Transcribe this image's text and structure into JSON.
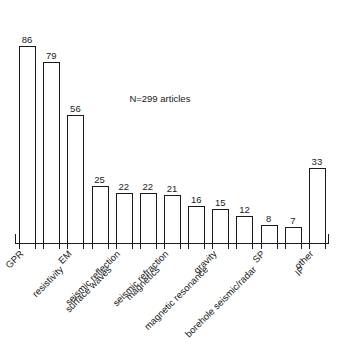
{
  "chart_data": {
    "type": "bar",
    "title": "",
    "subtitle": "",
    "xlabel": "",
    "ylabel": "",
    "ylim": [
      0,
      96
    ],
    "grid": false,
    "legend": null,
    "annotations": [
      {
        "text": "N=299 articles",
        "x_category": "magnetics",
        "value_position": 62
      }
    ],
    "categories": [
      "GPR",
      "resistivity",
      "EM",
      "surface waves",
      "seismic reflection",
      "magnetics",
      "seismic refraction",
      "magnetic resonance",
      "gravity",
      "borehole seismic/radar",
      "SP",
      "IP",
      "other"
    ],
    "values": [
      86,
      79,
      56,
      25,
      22,
      22,
      21,
      16,
      15,
      12,
      8,
      7,
      33
    ],
    "value_labels": [
      "86",
      "79",
      "56",
      "25",
      "22",
      "22",
      "21",
      "16",
      "15",
      "12",
      "8",
      "7",
      "33"
    ],
    "colors": {
      "bar_fill": "#ffffff",
      "bar_stroke": "#1a1a1a",
      "axis": "#1a1a1a",
      "text": "#1a1a1a",
      "background": "#ffffff"
    }
  }
}
